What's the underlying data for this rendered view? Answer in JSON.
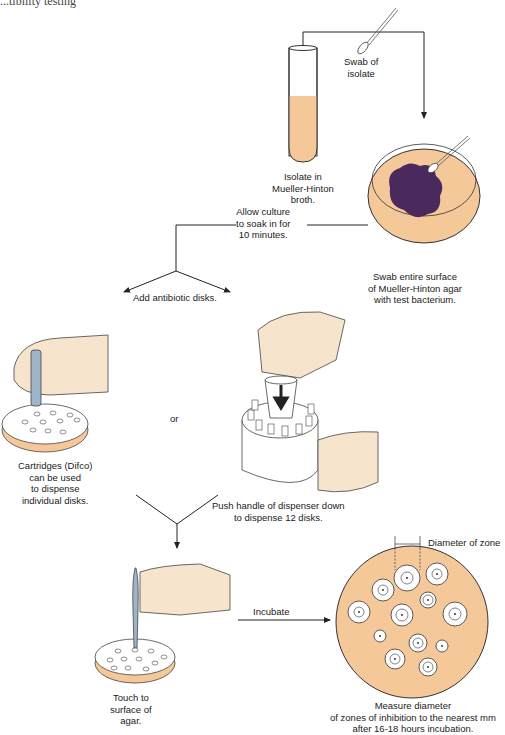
{
  "header": {
    "fragment": "...tibility testing"
  },
  "steps": {
    "swab": {
      "label": "Swab of\nisolate"
    },
    "broth": {
      "label": "Isolate in\nMueller-Hinton\nbroth."
    },
    "plate": {
      "label": "Swab entire surface\nof Mueller-Hinton agar\nwith test bacterium."
    },
    "soak": {
      "label": "Allow culture\nto soak in for\n10 minutes."
    },
    "add_disks": {
      "label": "Add antibiotic disks."
    },
    "cartridges": {
      "label": "Cartridges (Difco)\ncan be used\nto dispense\nindividual disks."
    },
    "or": {
      "label": "or"
    },
    "dispenser": {
      "label": "Push handle of dispenser down\nto dispense 12 disks."
    },
    "touch": {
      "label": "Touch to\nsurface of\nagar."
    },
    "incubate": {
      "label": "Incubate"
    },
    "zone": {
      "label": "Diameter of zone"
    },
    "measure": {
      "label": "Measure diameter\nof zones of inhibition to the nearest mm\nafter 16-18 hours incubation."
    }
  },
  "colors": {
    "agar": "#f5c89a",
    "bacteria": "#4a2a5c",
    "skin": "#f7e4cc",
    "tool": "#9fb4c8",
    "line": "#222222"
  }
}
